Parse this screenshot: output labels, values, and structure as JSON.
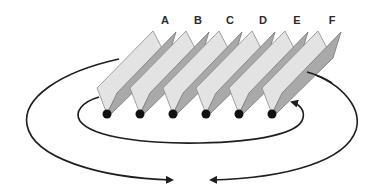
{
  "diagram": {
    "labels": [
      "A",
      "B",
      "C",
      "D",
      "E",
      "F"
    ],
    "colors": {
      "light_panel": "#e3e3e3",
      "dark_panel": "#a9a9a9",
      "arrows": "#1e1e1e",
      "pivot_dots": "#111111"
    },
    "arrows": [
      {
        "name": "outer-left-flow",
        "direction": "counterclockwise from plate A, around left, ending pointing right at bottom center"
      },
      {
        "name": "outer-right-flow",
        "direction": "clockwise from plate F, around right, ending pointing left at bottom center"
      },
      {
        "name": "inner-loop-flow",
        "direction": "from left of plate A, under the pivot dots, curling up to point at plate F"
      }
    ]
  }
}
